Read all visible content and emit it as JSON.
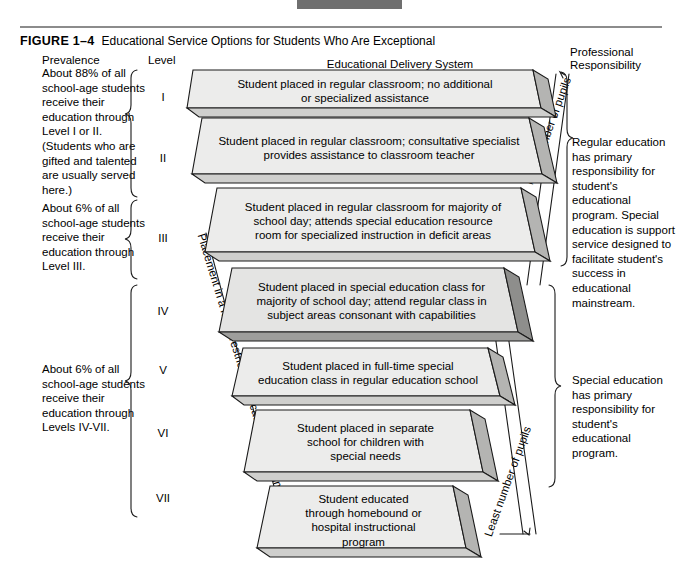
{
  "figure": {
    "tag": "FIGURE 1–4",
    "title": "Educational Service Options for Students Who Are Exceptional"
  },
  "headers": {
    "prevalence": "Prevalence",
    "level": "Level",
    "delivery_system": "Educational Delivery System",
    "professional_responsibility": "Professional\nResponsibility"
  },
  "prevalence_notes": [
    "About 88% of all school-age students receive their education through Level I or II.(Students who are gifted and talented are usually served here.)",
    "About 6% of all school-age students receive their education through Level III.",
    "About 6% of all school-age students receive their education through Levels IV-VII."
  ],
  "levels": [
    "I",
    "II",
    "III",
    "IV",
    "V",
    "VI",
    "VII"
  ],
  "delivery_levels": [
    {
      "level": "I",
      "lines": [
        "Student placed in regular classroom; no additional",
        "or specialized assistance"
      ]
    },
    {
      "level": "II",
      "lines": [
        "Student placed in regular classroom; consultative specialist",
        "provides assistance to classroom teacher"
      ]
    },
    {
      "level": "III",
      "lines": [
        "Student placed in regular classroom for majority of",
        "school day; attends special education resource",
        "room for specialized instruction in deficit areas"
      ]
    },
    {
      "level": "IV",
      "lines": [
        "Student placed in special education class for",
        "majority of school day; attend regular class in",
        "subject areas consonant with capabilities"
      ]
    },
    {
      "level": "V",
      "lines": [
        "Student placed in full-time special",
        "education class in regular education school"
      ]
    },
    {
      "level": "VI",
      "lines": [
        "Student placed in separate",
        "school for children with",
        "special needs"
      ]
    },
    {
      "level": "VII",
      "lines": [
        "Student educated",
        "through homebound or",
        "hospital instructional",
        "program"
      ]
    }
  ],
  "responsibility_notes": [
    "Regular education has primary responsibility for student's educational program. Special education is support service designed to facilitate student's success in educational mainstream.",
    "Special education has primary responsibility for student's educational program."
  ],
  "axis_labels": {
    "placement": "Placement in a more restricted educational environment",
    "most": "Most number of pupils",
    "least": "Least number of pupils"
  },
  "colors": {
    "slab_top": "#ececeb",
    "slab_side": "#b4b4b2",
    "slab_side_dark": "#8e8e8c",
    "slab_bottom": "#cfcfcd",
    "outline": "#1a1a1a",
    "rule": "#8c8c8c",
    "topbar": "#6f6f6f"
  }
}
